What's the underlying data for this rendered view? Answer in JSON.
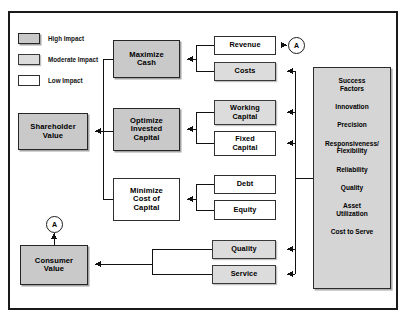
{
  "diagram": {
    "legend": {
      "items": [
        {
          "label": "High Impact",
          "impact": "high",
          "color": "#c9c9c9"
        },
        {
          "label": "Moderate Impact",
          "impact": "moderate",
          "color": "#dcdcdc"
        },
        {
          "label": "Low Impact",
          "impact": "low",
          "color": "#ffffff"
        }
      ]
    },
    "nodes": {
      "shareholder_value": {
        "label": "Shareholder\nValue",
        "impact": "high"
      },
      "consumer_value": {
        "label": "Consumer\nValue",
        "impact": "high"
      },
      "maximize_cash": {
        "label": "Maximize\nCash",
        "impact": "high"
      },
      "optimize_invested": {
        "label": "Optimize\nInvested\nCapital",
        "impact": "high"
      },
      "minimize_cost": {
        "label": "Minimize\nCost of\nCapital",
        "impact": "low"
      },
      "revenue": {
        "label": "Revenue",
        "impact": "low"
      },
      "costs": {
        "label": "Costs",
        "impact": "moderate"
      },
      "working_capital": {
        "label": "Working\nCapital",
        "impact": "moderate"
      },
      "fixed_capital": {
        "label": "Fixed\nCapital",
        "impact": "low"
      },
      "debt": {
        "label": "Debt",
        "impact": "low"
      },
      "equity": {
        "label": "Equity",
        "impact": "low"
      },
      "quality": {
        "label": "Quality",
        "impact": "moderate"
      },
      "service": {
        "label": "Service",
        "impact": "moderate"
      }
    },
    "connectors": {
      "a_top": "A",
      "a_bottom": "A"
    },
    "success_factors": {
      "heading": "Success\nFactors",
      "items": [
        "Innovation",
        "Precision",
        "Responsiveness/\nFlexibility",
        "Reliability",
        "Quality",
        "Asset\nUtilization",
        "Cost to Serve"
      ]
    }
  }
}
